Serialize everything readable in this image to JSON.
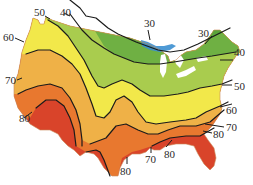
{
  "map": {
    "title": "",
    "type": "isotherm contour map of the contiguous United States",
    "units_implied": "degrees",
    "colors": {
      "band_lt30": "#5aa33a",
      "band_30_40": "#6fb043",
      "band_40_50": "#a9cc4e",
      "band_50_60": "#f2e84a",
      "band_60_70": "#efb147",
      "band_70_80": "#e8782f",
      "band_gt80": "#d9442a",
      "water": "#3b8fd0",
      "contour": "#1b1b1b",
      "background": "#ffffff"
    },
    "labels": [
      {
        "id": "w50",
        "text": "50"
      },
      {
        "id": "w40",
        "text": "40"
      },
      {
        "id": "n30",
        "text": "30"
      },
      {
        "id": "ne30",
        "text": "30"
      },
      {
        "id": "e40",
        "text": "40"
      },
      {
        "id": "w60",
        "text": "60"
      },
      {
        "id": "e50",
        "text": "50"
      },
      {
        "id": "w70",
        "text": "70"
      },
      {
        "id": "e60",
        "text": "60"
      },
      {
        "id": "w80",
        "text": "80"
      },
      {
        "id": "e70",
        "text": "70"
      },
      {
        "id": "e80",
        "text": "80"
      },
      {
        "id": "s80a",
        "text": "80"
      },
      {
        "id": "s70",
        "text": "70"
      },
      {
        "id": "s80b",
        "text": "80"
      }
    ]
  }
}
